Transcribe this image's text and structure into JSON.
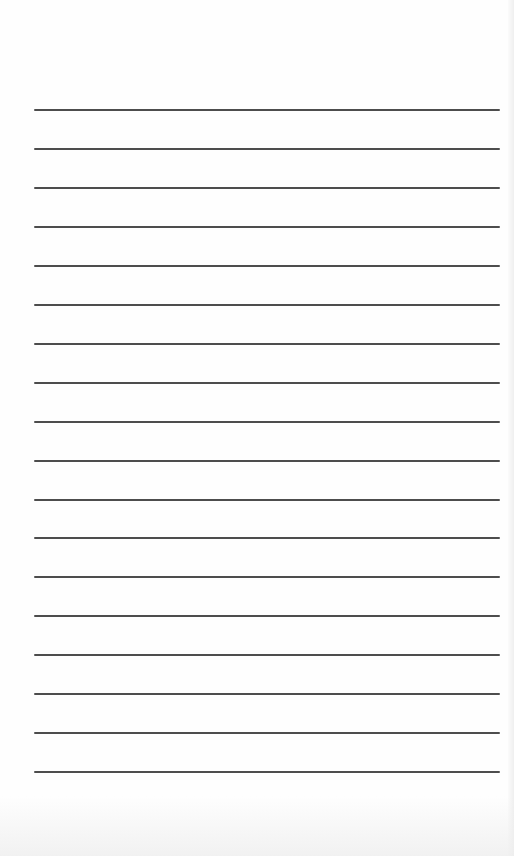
{
  "page": {
    "type": "lined-paper",
    "background_color": "#fefefe",
    "rule_color": "#4d4d4d",
    "rule_count": 18,
    "rules": [
      {
        "y": 110
      },
      {
        "y": 149
      },
      {
        "y": 188
      },
      {
        "y": 227
      },
      {
        "y": 266
      },
      {
        "y": 305
      },
      {
        "y": 344
      },
      {
        "y": 383
      },
      {
        "y": 422
      },
      {
        "y": 461
      },
      {
        "y": 500
      },
      {
        "y": 538
      },
      {
        "y": 577
      },
      {
        "y": 616
      },
      {
        "y": 655
      },
      {
        "y": 694
      },
      {
        "y": 733
      },
      {
        "y": 772
      }
    ],
    "lines_text": [
      "",
      "",
      "",
      "",
      "",
      "",
      "",
      "",
      "",
      "",
      "",
      "",
      "",
      "",
      "",
      "",
      "",
      ""
    ]
  }
}
